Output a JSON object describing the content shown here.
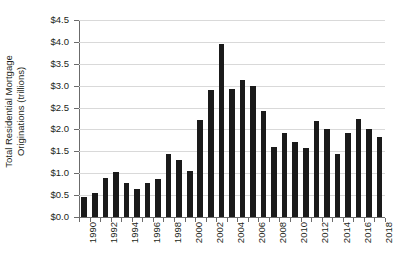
{
  "chart_data": {
    "type": "bar",
    "title": "",
    "subtitle": "",
    "xlabel": "",
    "ylabel": "Total Residential Mortgage Originations (trillions)",
    "ylabel_lines": [
      "Total Residential Mortgage",
      "Originations (trillions)"
    ],
    "ylim": [
      0.0,
      4.5
    ],
    "ytick_values": [
      0.0,
      0.5,
      1.0,
      1.5,
      2.0,
      2.5,
      3.0,
      3.5,
      4.0,
      4.5
    ],
    "ytick_labels": [
      "$0.0",
      "$0.5",
      "$1.0",
      "$1.5",
      "$2.0",
      "$2.5",
      "$3.0",
      "$3.5",
      "$4.0",
      "$4.5"
    ],
    "grid": true,
    "grid_axis": "y",
    "legend": false,
    "legend_position": "none",
    "bar_color": "#1a1a1a",
    "grid_color": "#d9d9d9",
    "axis_color": "#6b6b6b",
    "background_color": "#ffffff",
    "text_color": "#231f20",
    "xtick_rotation": -90,
    "xtick_label_interval": 2,
    "categories": [
      "1990",
      "1991",
      "1992",
      "1993",
      "1994",
      "1995",
      "1996",
      "1997",
      "1998",
      "1999",
      "2000",
      "2001",
      "2002",
      "2003",
      "2004",
      "2005",
      "2006",
      "2007",
      "2008",
      "2009",
      "2010",
      "2011",
      "2012",
      "2013",
      "2014",
      "2015",
      "2016",
      "2017",
      "2018"
    ],
    "xtick_labels_shown": [
      "1990",
      "",
      "1992",
      "",
      "1994",
      "",
      "1996",
      "",
      "1998",
      "",
      "2000",
      "",
      "2002",
      "",
      "2004",
      "",
      "2006",
      "",
      "2008",
      "",
      "2010",
      "",
      "2012",
      "",
      "2014",
      "",
      "2016",
      "",
      "2018"
    ],
    "values": [
      0.46,
      0.56,
      0.89,
      1.02,
      0.77,
      0.64,
      0.78,
      0.86,
      1.45,
      1.31,
      1.05,
      2.21,
      2.89,
      3.95,
      2.93,
      3.12,
      2.99,
      2.43,
      1.6,
      1.92,
      1.71,
      1.57,
      2.2,
      2.0,
      1.45,
      1.92,
      2.25,
      2.02,
      1.83
    ],
    "series": [
      {
        "name": "Total Residential Mortgage Originations",
        "values": [
          0.46,
          0.56,
          0.89,
          1.02,
          0.77,
          0.64,
          0.78,
          0.86,
          1.45,
          1.31,
          1.05,
          2.21,
          2.89,
          3.95,
          2.93,
          3.12,
          2.99,
          2.43,
          1.6,
          1.92,
          1.71,
          1.57,
          2.2,
          2.0,
          1.45,
          1.92,
          2.25,
          2.02,
          1.83
        ]
      }
    ]
  }
}
